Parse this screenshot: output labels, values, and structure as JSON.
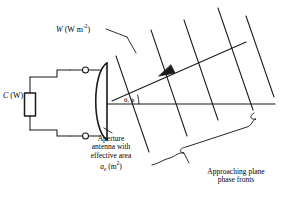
{
  "figure": {
    "background_color": "#ffffff",
    "stroke_color": "#1a1a1a",
    "labels": {
      "flux_density": {
        "symbol": "W",
        "units_open": " (W m",
        "units_exp": "-2",
        "units_close": ")"
      },
      "power": {
        "symbol": "C",
        "units": " (W)"
      },
      "angles": "θ, ϕ",
      "aperture_line1": "Aperture",
      "aperture_line2": "antenna with",
      "aperture_line3": "effective area",
      "aperture_symbol": "a",
      "aperture_subscript": "e",
      "aperture_units_open": " (m",
      "aperture_units_exp": "2",
      "aperture_units_close": ")",
      "wavefront_line1": "Approaching plane",
      "wavefront_line2": "phase fronts"
    },
    "elements": {
      "load_box": "load-resistor",
      "terminal_upper": "terminal-upper",
      "terminal_lower": "terminal-lower",
      "dish": "parabolic-dish-antenna",
      "boresight": "boresight-axis",
      "incidence_ray": "incidence-ray-arrow",
      "phase_fronts_count": 5,
      "brace": "wavefront-brace",
      "leader": "flux-leader-line"
    }
  }
}
